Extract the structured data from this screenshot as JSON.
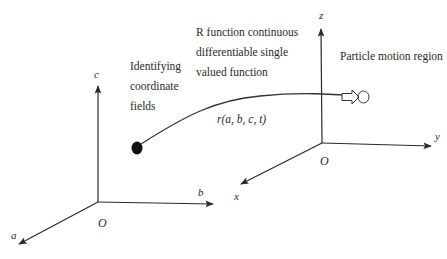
{
  "diagram": {
    "left_frame": {
      "name": "Identifying coordinate system",
      "origin_label": "O",
      "axes": {
        "vertical": "c",
        "horizontal": "b",
        "depth": "a"
      }
    },
    "right_frame": {
      "name": "Spatial coordinate system",
      "origin_label": "O",
      "axes": {
        "vertical": "z",
        "horizontal": "y",
        "depth": "x"
      }
    },
    "annotations": {
      "identifying": [
        "Identifying",
        "coordinate",
        "fields"
      ],
      "r_function": [
        "R function continuous",
        "differentiable single",
        "valued function"
      ],
      "particle_region": "Particle motion region",
      "mapping": "r(a, b, c, t)"
    },
    "colors": {
      "stroke": "#2a2a2a",
      "text": "#2a2a2a",
      "background": "#ffffff"
    }
  }
}
